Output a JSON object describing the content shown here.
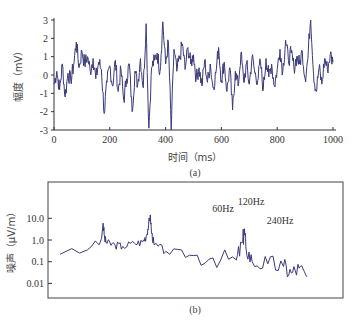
{
  "chart_data": [
    {
      "id": "a",
      "type": "line",
      "caption": "(a)",
      "title": "",
      "xlabel": "时间（ms）",
      "ylabel": "幅度（mV）",
      "xlim": [
        0,
        1000
      ],
      "ylim": [
        -3,
        3
      ],
      "x_ticks": [
        "0",
        "200",
        "400",
        "600",
        "800",
        "1000"
      ],
      "y_ticks": [
        "3",
        "2",
        "1",
        "0",
        "-1",
        "-2",
        "-3"
      ],
      "grid": false,
      "line_color": "#3a3a7a",
      "series": [
        {
          "name": "signal",
          "x": [
            0,
            10,
            20,
            30,
            40,
            50,
            60,
            70,
            80,
            90,
            100,
            110,
            120,
            130,
            140,
            150,
            160,
            170,
            180,
            190,
            200,
            210,
            220,
            230,
            240,
            250,
            260,
            270,
            280,
            290,
            300,
            310,
            320,
            330,
            340,
            350,
            360,
            370,
            380,
            390,
            400,
            410,
            420,
            430,
            440,
            450,
            460,
            470,
            480,
            490,
            500,
            510,
            520,
            530,
            540,
            550,
            560,
            570,
            580,
            590,
            600,
            610,
            620,
            630,
            640,
            650,
            660,
            670,
            680,
            690,
            700,
            710,
            720,
            730,
            740,
            750,
            760,
            770,
            780,
            790,
            800,
            810,
            820,
            830,
            840,
            850,
            860,
            870,
            880,
            890,
            900,
            910,
            920,
            930,
            940,
            950,
            960,
            970,
            980,
            990,
            1000
          ],
          "values": [
            -0.5,
            0.2,
            -0.8,
            0.6,
            -1.2,
            0.1,
            -0.3,
            0.5,
            1.8,
            0.4,
            1.3,
            0.6,
            1.0,
            0.2,
            0.9,
            -0.2,
            0.7,
            0.3,
            -2.1,
            -0.4,
            0.5,
            -0.6,
            0.8,
            -0.9,
            0.3,
            -1.4,
            -0.2,
            0.6,
            -2.0,
            0.2,
            -0.5,
            0.9,
            -0.7,
            2.8,
            -2.9,
            0.4,
            0.8,
            1.2,
            0.2,
            2.9,
            0.6,
            1.8,
            -3.0,
            1.4,
            0.2,
            0.9,
            1.7,
            0.3,
            1.5,
            0.6,
            1.1,
            -0.2,
            0.4,
            -0.6,
            0.8,
            -0.4,
            0.6,
            -0.7,
            0.1,
            1.5,
            -0.3,
            0.7,
            -0.9,
            0.4,
            -1.9,
            0.2,
            -0.6,
            1.2,
            -0.4,
            0.6,
            -0.5,
            1.0,
            0.1,
            -0.3,
            0.7,
            -0.8,
            0.9,
            -0.1,
            0.6,
            -0.6,
            0.3,
            1.4,
            0.2,
            1.9,
            0.8,
            1.2,
            0.4,
            1.0,
            0.6,
            1.3,
            -0.2,
            0.9,
            3.3,
            0.1,
            -0.9,
            0.4,
            -0.5,
            0.9,
            0.3,
            1.1,
            0.7
          ]
        }
      ],
      "annotations": []
    },
    {
      "id": "b",
      "type": "line",
      "caption": "(b)",
      "title": "",
      "xlabel": "",
      "ylabel": "噪声（μV/m）",
      "yscale": "log",
      "ylim": [
        0.005,
        100
      ],
      "y_ticks": [
        "10.0",
        "1.0",
        "0.1",
        "0.01"
      ],
      "x_ticks": [],
      "grid": false,
      "line_color": "#3a3a7a",
      "series": [
        {
          "name": "noise spectrum",
          "x_hz": [
            5,
            20,
            30,
            40,
            45,
            50,
            55,
            58,
            60,
            62,
            65,
            75,
            85,
            100,
            110,
            115,
            118,
            120,
            122,
            125,
            140,
            170,
            200,
            230,
            238,
            240,
            242,
            250,
            270,
            290,
            300,
            310,
            320
          ],
          "values": [
            0.22,
            0.4,
            0.25,
            0.35,
            0.5,
            0.9,
            0.6,
            1.2,
            6.0,
            1.1,
            0.7,
            0.6,
            0.5,
            0.7,
            0.8,
            1.5,
            5.0,
            14.0,
            2.0,
            0.6,
            0.3,
            0.2,
            0.15,
            0.12,
            0.8,
            3.0,
            0.5,
            0.1,
            0.08,
            0.06,
            0.03,
            0.05,
            0.02
          ]
        }
      ],
      "annotations": [
        {
          "text": "60Hz"
        },
        {
          "text": "120Hz"
        },
        {
          "text": "240Hz"
        }
      ]
    }
  ]
}
